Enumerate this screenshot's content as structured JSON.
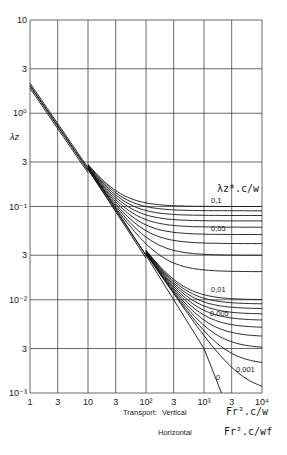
{
  "chart_data": {
    "type": "line",
    "title": "",
    "xscale": "log",
    "yscale": "log",
    "xlim": [
      1,
      10000
    ],
    "ylim": [
      0.001,
      10
    ],
    "grid": true,
    "x_ticks": [
      "1",
      "3",
      "10",
      "3",
      "10²",
      "3",
      "10³",
      "3",
      "10⁴"
    ],
    "y_ticks": [
      "10",
      "3",
      "10⁰",
      "3",
      "10⁻¹",
      "3",
      "10⁻²",
      "3",
      "10⁻³"
    ],
    "ylabel": "λz",
    "xlabel_vertical": {
      "prefix": "Transport:",
      "mode": "Vertical",
      "expr": "Fr².c/w"
    },
    "xlabel_horizontal": {
      "mode": "Horizontal",
      "expr": "Fr².c/wf"
    },
    "parameter_label": "λz*.c/w",
    "curve_labels": [
      "0,1",
      "0,05",
      "0,01",
      "0,005",
      "0,001",
      "0"
    ],
    "series": [
      {
        "name": "0.1",
        "asymptote": 0.1
      },
      {
        "name": "0.05",
        "asymptote": 0.05
      },
      {
        "name": "0.01",
        "asymptote": 0.01
      },
      {
        "name": "0.005",
        "asymptote": 0.005
      },
      {
        "name": "0.001",
        "asymptote": 0.001
      },
      {
        "name": "0",
        "x": [
          1,
          10,
          100,
          1000,
          2000
        ],
        "y": [
          2.0,
          0.25,
          0.03,
          0.003,
          0.001
        ]
      }
    ],
    "upper_family_asymptotes": [
      0.1,
      0.09,
      0.08,
      0.07,
      0.06,
      0.05,
      0.04,
      0.03,
      0.02
    ],
    "lower_family_asymptotes": [
      0.01,
      0.009,
      0.008,
      0.007,
      0.006,
      0.005,
      0.004,
      0.003,
      0.002,
      0.001
    ]
  }
}
